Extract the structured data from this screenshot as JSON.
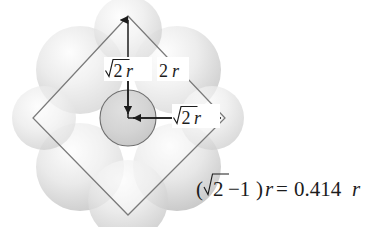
{
  "figure": {
    "background_color": "#ffffff",
    "stroke_color": "#7d7d7d",
    "arrow_color": "#1c1c1c",
    "circle_fill": "#d2d2d2",
    "sphere_shade_color": "#e3e3e3"
  },
  "labels": {
    "vertical_dimension": {
      "radicand": "2",
      "variable": "r",
      "full_text": "√2 r"
    },
    "edge_dimension": {
      "coefficient": "2",
      "variable": "r",
      "full_text": "2r"
    },
    "horizontal_dimension": {
      "radicand": "2",
      "variable": "r",
      "full_text": "√2 r"
    }
  },
  "equation": {
    "open_paren": "(",
    "radicand": "2",
    "minus_one": "−1",
    "close_paren": ")",
    "left_variable": "r",
    "equals": "=",
    "value": "0.414",
    "right_variable": "r",
    "full_text": "(√2−1)r=0.414 r"
  },
  "geometry": {
    "square_vertices": {
      "top": "128,16",
      "right": "225,118",
      "bottom": "128,215",
      "left": "33,118"
    },
    "inner_circle": {
      "center_x": "128",
      "center_y": "118",
      "radius": "28"
    }
  }
}
